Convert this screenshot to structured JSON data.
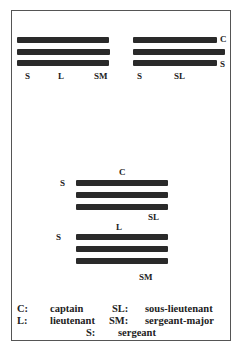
{
  "diagram": {
    "insignia": [
      {
        "id": "top-left",
        "bars": 3,
        "labels": [
          "S",
          "L",
          "SM"
        ]
      },
      {
        "id": "top-right",
        "bars": 3,
        "labels": [
          "C",
          "S",
          "S",
          "SL"
        ]
      },
      {
        "id": "middle",
        "bars": 3,
        "labels": [
          "C",
          "S",
          "SL"
        ]
      },
      {
        "id": "bottom",
        "bars": 3,
        "labels": [
          "L",
          "S",
          "SM"
        ]
      }
    ],
    "legend": [
      {
        "abbr": "C:",
        "meaning": "captain"
      },
      {
        "abbr": "SL:",
        "meaning": "sous-lieutenant"
      },
      {
        "abbr": "L:",
        "meaning": "lieutenant"
      },
      {
        "abbr": "SM:",
        "meaning": "sergeant-major"
      },
      {
        "abbr": "S:",
        "meaning": "sergeant"
      }
    ]
  }
}
